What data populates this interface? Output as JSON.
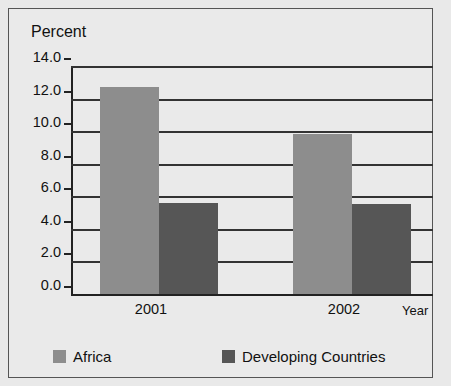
{
  "chart_data": {
    "type": "bar",
    "title": "",
    "ylabel": "Percent",
    "xlabel": "Year",
    "categories": [
      "2001",
      "2002"
    ],
    "series": [
      {
        "name": "Africa",
        "color": "#8d8d8d",
        "values": [
          12.7,
          9.8
        ]
      },
      {
        "name": "Developing Countries",
        "color": "#565656",
        "values": [
          5.6,
          5.5
        ]
      }
    ],
    "ylim": [
      0.0,
      14.0
    ],
    "ytick_step": 2.0,
    "ytick_labels": [
      "14.0",
      "12.0",
      "10.0",
      "8.0",
      "6.0",
      "4.0",
      "2.0",
      "0.0"
    ],
    "ytick_values": [
      14.0,
      12.0,
      10.0,
      8.0,
      6.0,
      4.0,
      2.0,
      0.0
    ],
    "grid": true,
    "legend_position": "bottom"
  },
  "axes": {
    "y_title": "Percent",
    "x_title": "Year"
  },
  "legend": {
    "items": [
      {
        "label": "Africa",
        "color": "#8d8d8d"
      },
      {
        "label": "Developing Countries",
        "color": "#565656"
      }
    ]
  },
  "colors": {
    "background": "#eaeaea",
    "frame": "#555555",
    "axis": "#222222",
    "grid": "#333333",
    "series_a": "#8d8d8d",
    "series_b": "#565656"
  }
}
